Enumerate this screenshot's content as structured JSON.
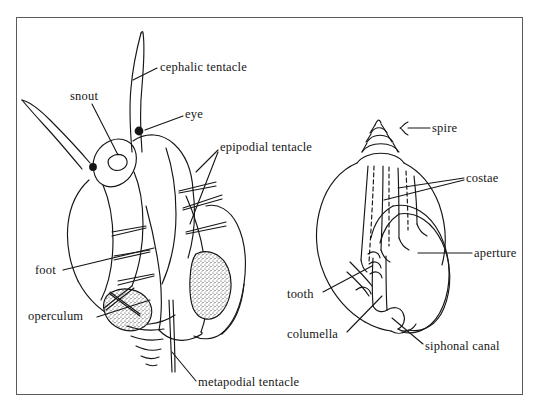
{
  "figure": {
    "type": "scientific-illustration",
    "panels": [
      {
        "id": "soft-body",
        "name": "snail-soft-body"
      },
      {
        "id": "shell",
        "name": "snail-shell"
      }
    ],
    "border_color": "#5a5a5a",
    "ink_color": "#161616",
    "background_color": "#ffffff"
  },
  "labels": {
    "cephalic_tentacle": "cephalic tentacle",
    "snout": "snout",
    "eye": "eye",
    "epipodial_tentacle": "epipodial tentacle",
    "foot": "foot",
    "operculum": "operculum",
    "metapodial_tentacle": "metapodial tentacle",
    "spire": "spire",
    "costae": "costae",
    "aperture": "aperture",
    "tooth": "tooth",
    "columella": "columella",
    "siphonal_canal": "siphonal canal"
  }
}
